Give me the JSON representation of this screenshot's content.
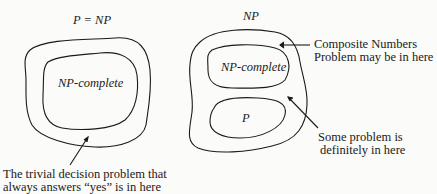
{
  "left_diagram": {
    "title": "P = NP",
    "inner_region": "NP-complete",
    "annotation_line1": "The trivial decision problem that",
    "annotation_line2": "always answers “yes” is in here"
  },
  "right_diagram": {
    "title": "NP",
    "upper_region": "NP-complete",
    "lower_region": "P",
    "annotation_top_line1": "Composite Numbers",
    "annotation_top_line2": "Problem may be in here",
    "annotation_bottom_line1": "Some problem is",
    "annotation_bottom_line2": "definitely in here"
  },
  "colors": {
    "stroke": "#1a1a1a",
    "background": "#fbfbf9"
  }
}
